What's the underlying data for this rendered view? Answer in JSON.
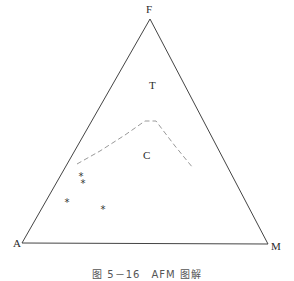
{
  "diagram": {
    "type": "ternary",
    "vertices": {
      "top": {
        "label": "F",
        "x": 150,
        "y": 19
      },
      "left": {
        "label": "A",
        "x": 22,
        "y": 243
      },
      "right": {
        "label": "M",
        "x": 268,
        "y": 244
      }
    },
    "fields": [
      {
        "label": "T",
        "x": 152,
        "y": 85
      },
      {
        "label": "C",
        "x": 146,
        "y": 155
      }
    ],
    "boundary_line": {
      "style": "dashed",
      "color": "#999999",
      "points": [
        [
          77,
          164
        ],
        [
          100,
          151
        ],
        [
          125,
          135
        ],
        [
          145,
          121
        ],
        [
          156,
          121
        ],
        [
          162,
          129
        ],
        [
          175,
          146
        ],
        [
          193,
          168
        ]
      ]
    },
    "points": [
      {
        "symbol": "*",
        "x": 81,
        "y": 177
      },
      {
        "symbol": "*",
        "x": 83,
        "y": 184
      },
      {
        "symbol": "*",
        "x": 67,
        "y": 203
      },
      {
        "symbol": "*",
        "x": 103,
        "y": 210
      }
    ],
    "caption": "图 5－16　AFM 图解"
  }
}
